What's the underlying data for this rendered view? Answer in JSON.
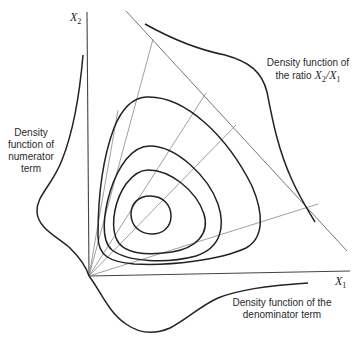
{
  "figure": {
    "axes": {
      "x_label": "X",
      "x_label_sub": "1",
      "y_label": "X",
      "y_label_sub": "2"
    },
    "annotations": {
      "ratio": {
        "line1": "Density function of",
        "line2_prefix": "the ratio ",
        "line2_math_a": "X",
        "line2_math_a_sub": "2",
        "line2_slash": "/",
        "line2_math_b": "X",
        "line2_math_b_sub": "1"
      },
      "numerator": {
        "line1": "Density",
        "line2": "function of",
        "line3": "numerator",
        "line4": "term"
      },
      "denominator": {
        "line1": "Density function of the",
        "line2": "denominator term"
      }
    },
    "elements": {
      "contour_count": 4,
      "ray_count": 5,
      "colors": {
        "curve": "#222222",
        "thin_line": "#777777",
        "axis": "#444444",
        "background": "#ffffff"
      }
    }
  }
}
